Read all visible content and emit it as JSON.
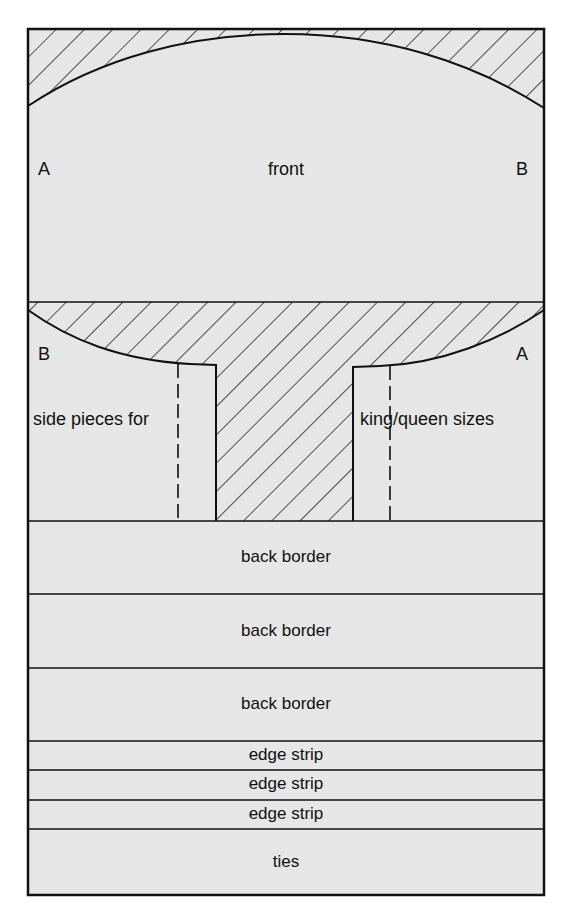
{
  "diagram": {
    "colors": {
      "fill": "#e6e6e6",
      "line": "#111111",
      "background": "#ffffff"
    },
    "front": {
      "label": "front",
      "left_marker": "A",
      "right_marker": "B"
    },
    "side_section": {
      "left_marker": "B",
      "right_marker": "A",
      "left_label": "side pieces for",
      "right_label": "king/queen sizes"
    },
    "strips": [
      {
        "label": "back border"
      },
      {
        "label": "back border"
      },
      {
        "label": "back border"
      },
      {
        "label": "edge strip"
      },
      {
        "label": "edge strip"
      },
      {
        "label": "edge strip"
      },
      {
        "label": "ties"
      }
    ]
  }
}
